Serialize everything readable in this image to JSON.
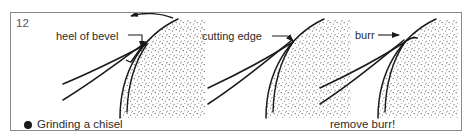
{
  "figure": {
    "plate_number": "12",
    "frame_color": "#8c8c8c",
    "background_color": "#ffffff",
    "ink_color": "#1a1a1a",
    "stipple_color": "#2b2b2b",
    "bullet_icon": "filled-circle-bullet"
  },
  "captions": {
    "left": "Grinding a chisel",
    "right": "remove burr!"
  },
  "panels": [
    {
      "id": "panel-1",
      "label": "heel of bevel",
      "label_icon": "leader-line-with-arrow",
      "rotation_arrow": "curved-arrow-left",
      "caption": "Grinding a chisel"
    },
    {
      "id": "panel-2",
      "label": "cutting edge",
      "label_icon": "leader-line-with-arrow",
      "rotation_arrow": "",
      "caption": ""
    },
    {
      "id": "panel-3",
      "label": "burr",
      "label_icon": "leader-line-with-arrow",
      "rotation_arrow": "",
      "caption": "remove burr!"
    }
  ]
}
